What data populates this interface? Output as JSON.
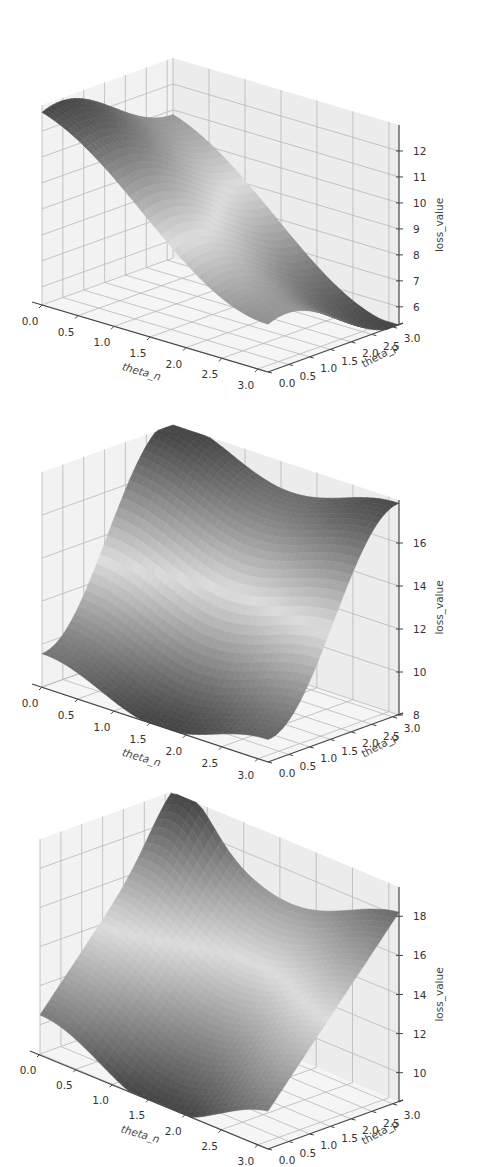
{
  "page": {
    "background": "#ffffff"
  },
  "chart_data": [
    {
      "type": "surface3d",
      "title": "",
      "xlabel": "theta_n",
      "ylabel": "theta_p",
      "zlabel": "loss_value",
      "x_ticks": [
        "0.0",
        "0.5",
        "1.0",
        "1.5",
        "2.0",
        "2.5",
        "3.0"
      ],
      "y_ticks": [
        "0.0",
        "0.5",
        "1.0",
        "1.5",
        "2.0",
        "2.5",
        "3.0"
      ],
      "z_ticks": [
        "6",
        "7",
        "8",
        "9",
        "10",
        "11",
        "12"
      ],
      "xlim": [
        0,
        3.14
      ],
      "ylim": [
        0,
        3.14
      ],
      "zlim": [
        5.3,
        13
      ],
      "colormap": "gray (dark at extremes, light at middle values)",
      "surface_description": "Saddle-like tilted sheet: maximum ~12.7 near theta_n=0, theta_p=3.1 (back corner), minimum ~5.5 near theta_n=3.1, theta_p=0 (front corner); ~8.5 along the other two corners.",
      "corner_values": {
        "n0_p0": 8.4,
        "n0_p3": 12.7,
        "n3_p0": 5.5,
        "n3_p3": 8.6
      }
    },
    {
      "type": "surface3d",
      "title": "",
      "xlabel": "theta_n",
      "ylabel": "theta_p",
      "zlabel": "loss_value",
      "x_ticks": [
        "0.0",
        "0.5",
        "1.0",
        "1.5",
        "2.0",
        "2.5",
        "3.0"
      ],
      "y_ticks": [
        "0.0",
        "0.5",
        "1.0",
        "1.5",
        "2.0",
        "2.5",
        "3.0"
      ],
      "z_ticks": [
        "8",
        "10",
        "12",
        "14",
        "16"
      ],
      "xlim": [
        0,
        3.14
      ],
      "ylim": [
        0,
        3.14
      ],
      "zlim": [
        8,
        18
      ],
      "colormap": "gray",
      "surface_description": "Trough along low theta_p rising steeply to high theta_p; wavy along theta_n with a dip near theta_n~1.6. Max ~17.8 at back-left corner, min ~8.3 at front.",
      "corner_values": {
        "n0_p0": 9.3,
        "n0_p3": 17.8,
        "n3_p0": 8.6,
        "n3_p3": 17.4
      }
    },
    {
      "type": "surface3d",
      "title": "",
      "xlabel": "theta_n",
      "ylabel": "theta_p",
      "zlabel": "loss_value",
      "x_ticks": [
        "0.0",
        "0.5",
        "1.0",
        "1.5",
        "2.0",
        "2.5",
        "3.0"
      ],
      "y_ticks": [
        "0.0",
        "0.5",
        "1.0",
        "1.5",
        "2.0",
        "2.5",
        "3.0"
      ],
      "z_ticks": [
        "10",
        "12",
        "14",
        "16",
        "18"
      ],
      "xlim": [
        0,
        3.14
      ],
      "ylim": [
        0,
        3.14
      ],
      "zlim": [
        8.5,
        19.5
      ],
      "colormap": "gray",
      "surface_description": "Tilted plane rising with theta_p, with a peaked ridge near theta_n~0.3 at high theta_p (max ~19.3) and a shallow basin near theta_n~1.2 at low theta_p (min ~8.8).",
      "corner_values": {
        "n0_p0": 11.5,
        "n0_p3": 17.5,
        "n3_p0": 8.8,
        "n3_p3": 17.6
      }
    }
  ]
}
